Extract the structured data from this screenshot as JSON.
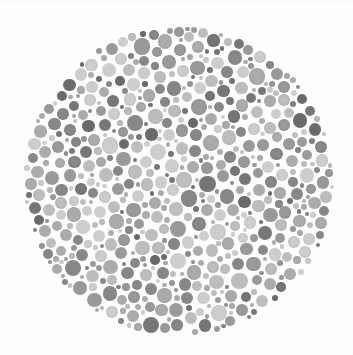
{
  "image": {
    "kind": "ishihara-color-vision-test-plate",
    "title": "Ishihara Test Plate",
    "caption": "",
    "width": 353,
    "height": 355,
    "background_color": "#fefefe",
    "rendering": "grayscale"
  },
  "plate": {
    "label": "pseudoisochromatic dot plate",
    "center_x": 179,
    "center_y": 181,
    "radius": 156,
    "hidden_figure_visible": false,
    "hidden_figure_note": "not discernible in grayscale reproduction"
  },
  "dot_field": {
    "label": "confetti dot field",
    "seed": 20240607,
    "count_target": 1150,
    "min_diameter": 3.5,
    "max_diameter": 16.5,
    "gap": 0.9,
    "size_weights": [
      {
        "diameter": 4.2,
        "weight": 26
      },
      {
        "diameter": 6.0,
        "weight": 22
      },
      {
        "diameter": 8.0,
        "weight": 19
      },
      {
        "diameter": 10.0,
        "weight": 15
      },
      {
        "diameter": 12.2,
        "weight": 11
      },
      {
        "diameter": 14.4,
        "weight": 5
      },
      {
        "diameter": 16.2,
        "weight": 2
      }
    ],
    "tones": [
      {
        "name": "light",
        "color": "#cdcdcd",
        "weight": 21
      },
      {
        "name": "light-medium",
        "color": "#bdbdbd",
        "weight": 17
      },
      {
        "name": "medium",
        "color": "#ababab",
        "weight": 19
      },
      {
        "name": "medium-dark",
        "color": "#999999",
        "weight": 16
      },
      {
        "name": "dark",
        "color": "#878787",
        "weight": 14
      },
      {
        "name": "darker",
        "color": "#767676",
        "weight": 9
      },
      {
        "name": "darkest",
        "color": "#6a6a6a",
        "weight": 4
      }
    ],
    "texture": {
      "grain_opacity": 0.12,
      "edge_softness_px": 0.6
    }
  }
}
